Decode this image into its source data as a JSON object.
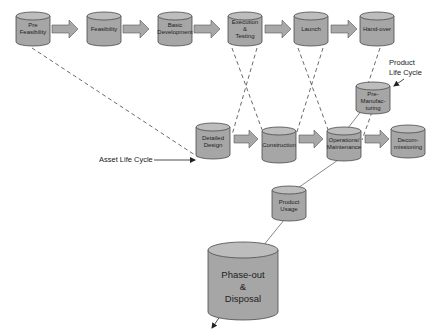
{
  "colors": {
    "cylinder_fill": "#a6a6a6",
    "cylinder_top": "#bdbdbd",
    "cylinder_stroke": "#4a4a4a",
    "arrow_fill": "#a8a8a8",
    "line": "#444444",
    "background": "#ffffff"
  },
  "top_row": {
    "nodes": [
      {
        "id": "pre-feasibility",
        "label_lines": [
          "Pre",
          "Feasibility"
        ]
      },
      {
        "id": "feasibility",
        "label_lines": [
          "Feasibility"
        ]
      },
      {
        "id": "basic-development",
        "label_lines": [
          "Basic",
          "Development"
        ]
      },
      {
        "id": "execution-testing",
        "label_lines": [
          "Execution",
          "&",
          "Testing"
        ]
      },
      {
        "id": "launch",
        "label_lines": [
          "Launch"
        ]
      },
      {
        "id": "hand-over",
        "label_lines": [
          "Hand-over"
        ]
      }
    ]
  },
  "middle_row": {
    "nodes": [
      {
        "id": "detailed-design",
        "label_lines": [
          "Detailed",
          "Design"
        ]
      },
      {
        "id": "construction",
        "label_lines": [
          "Construction"
        ]
      },
      {
        "id": "operations-maintenance",
        "label_lines": [
          "Operations/",
          "Maintenance"
        ]
      },
      {
        "id": "decommissioning",
        "label_lines": [
          "Decom-",
          "missioning"
        ]
      }
    ]
  },
  "other_nodes": {
    "pre_manufacturing": {
      "label_lines": [
        "Pre-",
        "Manufac-",
        "turing"
      ]
    },
    "product_usage": {
      "label_lines": [
        "Product",
        "Usage"
      ]
    },
    "phase_out": {
      "label_lines": [
        "Phase-out",
        "&",
        "Disposal"
      ]
    }
  },
  "annotations": {
    "asset_life_cycle": "Asset Life Cycle",
    "product_life_cycle_line1": "Product",
    "product_life_cycle_line2": "Life Cycle"
  }
}
